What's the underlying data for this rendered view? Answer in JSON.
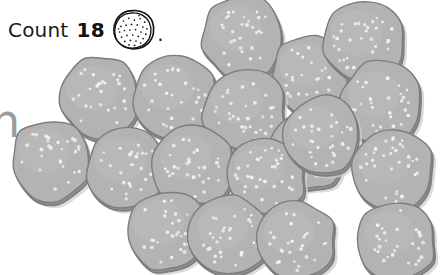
{
  "instruction": {
    "verb": "Count",
    "number": "18",
    "period": ".",
    "icon_name": "cookie-outline-icon",
    "full_text": "Count 18 (cookie)."
  },
  "edge_glyph": {
    "text": "n",
    "note": "partially cropped gray letter at left edge"
  },
  "colors": {
    "background": "#ffffff",
    "cookie_fill": "#b3b3b3",
    "cookie_fill_light": "#bcbcbc",
    "cookie_edge": "#8f8f8f",
    "cookie_outline": "#7d7d7d",
    "sprinkle": "#f2f2f2",
    "shadow": "#cfcfcf",
    "text": "#1a1a1a",
    "edge_glyph": "#9b9b9b"
  },
  "chart_data": {
    "type": "scatter",
    "title": "Count 18",
    "xlabel": "",
    "ylabel": "",
    "categories": [
      "cookie"
    ],
    "values": [
      18
    ],
    "total_count": 18,
    "x": [
      243,
      311,
      364,
      99,
      175,
      244,
      309,
      381,
      51,
      127,
      193,
      266,
      321,
      392,
      166,
      230,
      296,
      396
    ],
    "y": [
      37,
      74,
      42,
      97,
      96,
      110,
      149,
      103,
      160,
      168,
      166,
      176,
      136,
      170,
      231,
      236,
      240,
      241
    ]
  },
  "cookies": [
    {
      "id": "cookie-1",
      "cx": 243,
      "cy": 37,
      "r": 41,
      "seed": 11
    },
    {
      "id": "cookie-2",
      "cx": 311,
      "cy": 74,
      "r": 39,
      "seed": 23
    },
    {
      "id": "cookie-3",
      "cx": 364,
      "cy": 42,
      "r": 41,
      "seed": 31
    },
    {
      "id": "cookie-4",
      "cx": 99,
      "cy": 97,
      "r": 40,
      "seed": 47
    },
    {
      "id": "cookie-5",
      "cx": 175,
      "cy": 96,
      "r": 41,
      "seed": 53
    },
    {
      "id": "cookie-6",
      "cx": 244,
      "cy": 110,
      "r": 41,
      "seed": 61
    },
    {
      "id": "cookie-7",
      "cx": 309,
      "cy": 149,
      "r": 39,
      "seed": 73
    },
    {
      "id": "cookie-8",
      "cx": 381,
      "cy": 103,
      "r": 41,
      "seed": 83
    },
    {
      "id": "cookie-9",
      "cx": 51,
      "cy": 160,
      "r": 40,
      "seed": 97
    },
    {
      "id": "cookie-10",
      "cx": 127,
      "cy": 168,
      "r": 40,
      "seed": 103
    },
    {
      "id": "cookie-11",
      "cx": 193,
      "cy": 166,
      "r": 40,
      "seed": 113
    },
    {
      "id": "cookie-12",
      "cx": 266,
      "cy": 176,
      "r": 39,
      "seed": 127
    },
    {
      "id": "cookie-13",
      "cx": 321,
      "cy": 136,
      "r": 39,
      "seed": 137
    },
    {
      "id": "cookie-14",
      "cx": 392,
      "cy": 170,
      "r": 41,
      "seed": 149
    },
    {
      "id": "cookie-15",
      "cx": 166,
      "cy": 231,
      "r": 40,
      "seed": 157
    },
    {
      "id": "cookie-16",
      "cx": 230,
      "cy": 236,
      "r": 40,
      "seed": 167
    },
    {
      "id": "cookie-17",
      "cx": 296,
      "cy": 240,
      "r": 39,
      "seed": 179
    },
    {
      "id": "cookie-18",
      "cx": 396,
      "cy": 241,
      "r": 39,
      "seed": 191
    }
  ]
}
